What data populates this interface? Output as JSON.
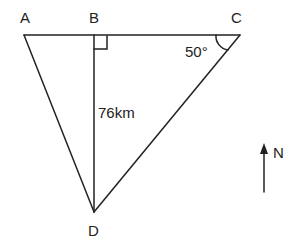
{
  "diagram": {
    "points": {
      "A": {
        "label": "A"
      },
      "B": {
        "label": "B"
      },
      "C": {
        "label": "C"
      },
      "D": {
        "label": "D"
      }
    },
    "segments": [
      "AB",
      "BC",
      "AD",
      "BD",
      "CD"
    ],
    "right_angle_at": "B",
    "measures": {
      "BD_length": "76km",
      "angle_C": "50°"
    },
    "north_indicator": {
      "label": "N"
    }
  },
  "colors": {
    "stroke": "#222222",
    "background": "#ffffff"
  }
}
